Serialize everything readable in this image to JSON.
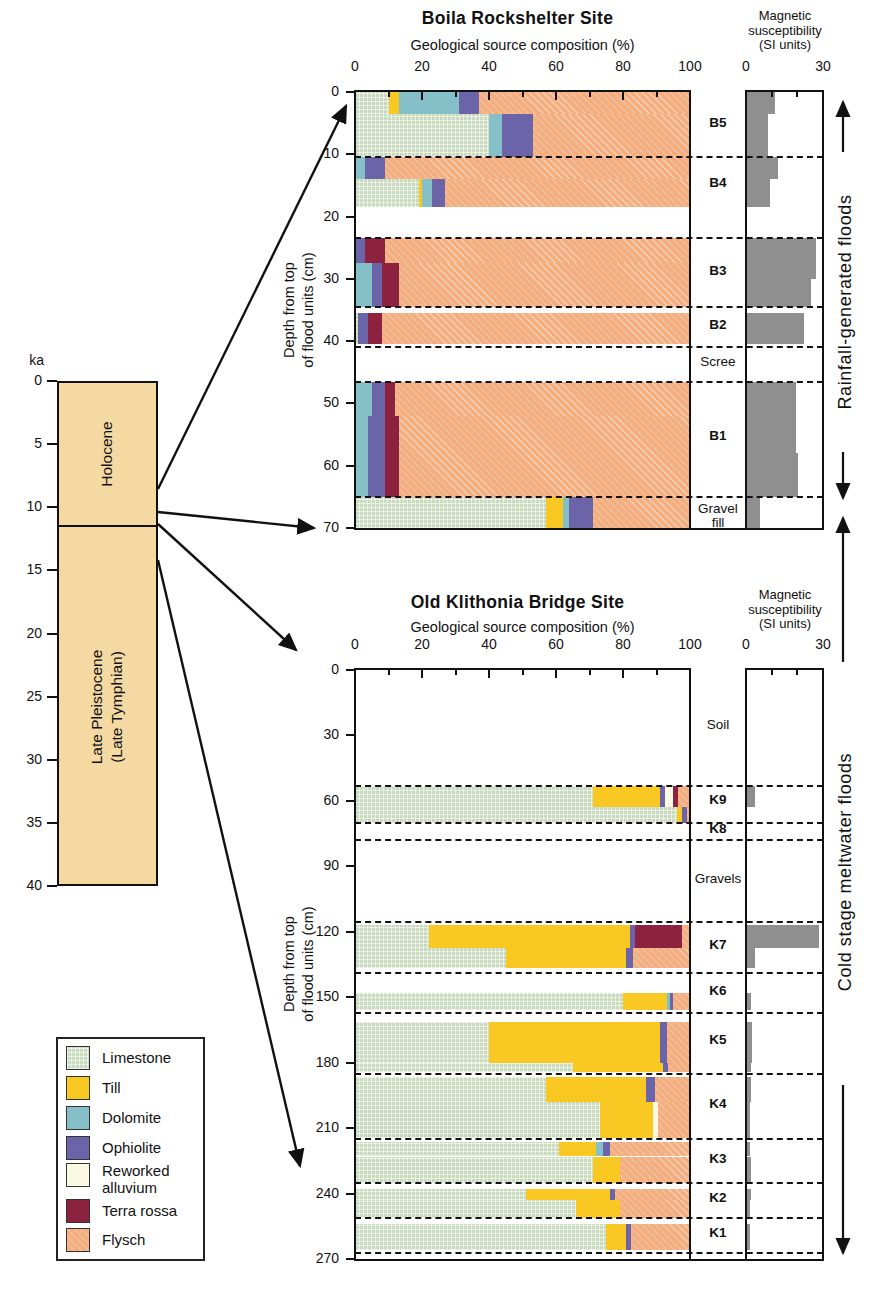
{
  "palette": {
    "axis_line": "#111111",
    "ms_bar": "#8f8f8f",
    "timeline_fill": "#f4d9a2"
  },
  "legend": {
    "items": [
      {
        "label": "Limestone",
        "color": "#c9dabf",
        "pattern": "grid"
      },
      {
        "label": "Till",
        "color": "#f9c823",
        "pattern": "solid"
      },
      {
        "label": "Dolomite",
        "color": "#85bfc7",
        "pattern": "solid"
      },
      {
        "label": "Ophiolite",
        "color": "#6b64a9",
        "pattern": "solid"
      },
      {
        "label": "Reworked alluvium",
        "color": "#fafae2",
        "pattern": "solid"
      },
      {
        "label": "Terra rossa",
        "color": "#8c2140",
        "pattern": "solid"
      },
      {
        "label": "Flysch",
        "color": "#f5ae80",
        "pattern": "diag"
      }
    ]
  },
  "timeline": {
    "axis_label": "ka",
    "ticks": [
      0,
      5,
      10,
      15,
      20,
      25,
      30,
      35,
      40
    ],
    "range": [
      0,
      40
    ],
    "epochs": [
      {
        "name": "Holocene",
        "start_ka": 0,
        "end_ka": 11.5
      },
      {
        "name_lines": [
          "Late Pleistocene",
          "(Late Tymphian)"
        ],
        "start_ka": 11.5,
        "end_ka": 40
      }
    ]
  },
  "flood_arrows": [
    {
      "label": "Rainfall-generated floods"
    },
    {
      "label": "Cold stage meltwater floods"
    }
  ],
  "chart_data": [
    {
      "type": "bar",
      "site": "Boila Rockshelter Site",
      "xlabel": "Geological source composition (%)",
      "x_range": [
        0,
        100
      ],
      "x_ticks": [
        0,
        20,
        40,
        60,
        80,
        100
      ],
      "x_minor_ticks": [
        10,
        30,
        50,
        70,
        90
      ],
      "depth_axis_label_lines": [
        "Depth from top",
        "of flood units (cm)"
      ],
      "depth_ticks": [
        0,
        10,
        20,
        30,
        40,
        50,
        60,
        70
      ],
      "depth_range": [
        0,
        70
      ],
      "ms_title_lines": [
        "Magnetic",
        "susceptibility",
        "(SI units)"
      ],
      "ms_ticks": [
        0,
        30
      ],
      "ms_minor_ticks": [
        10,
        20
      ],
      "ms_range": [
        0,
        30
      ],
      "unit_boundaries_cm": [
        10.5,
        23.5,
        34.5,
        41,
        46.5,
        65
      ],
      "units": [
        {
          "name": "B5",
          "label_depth_cm": 5.3,
          "bold": true
        },
        {
          "name": "B4",
          "label_depth_cm": 15,
          "bold": true
        },
        {
          "name": "B3",
          "label_depth_cm": 29,
          "bold": true
        },
        {
          "name": "B2",
          "label_depth_cm": 37.7,
          "bold": true
        },
        {
          "name": "Scree",
          "label_depth_cm": 43.7,
          "bold": false
        },
        {
          "name": "B1",
          "label_depth_cm": 55.5,
          "bold": true
        },
        {
          "name": "Gravel fill",
          "label_depth_cm": 67.3,
          "bold": false
        }
      ],
      "bars": [
        {
          "depth_top": 0,
          "depth_bottom": 3.5,
          "segments": [
            [
              "Limestone",
              10
            ],
            [
              "Till",
              3
            ],
            [
              "Dolomite",
              18
            ],
            [
              "Ophiolite",
              6
            ],
            [
              "Flysch",
              63
            ]
          ]
        },
        {
          "depth_top": 3.5,
          "depth_bottom": 10.5,
          "segments": [
            [
              "Limestone",
              40
            ],
            [
              "Dolomite",
              4
            ],
            [
              "Ophiolite",
              9
            ],
            [
              "Flysch",
              47
            ]
          ]
        },
        {
          "depth_top": 10.5,
          "depth_bottom": 14,
          "segments": [
            [
              "Dolomite",
              3
            ],
            [
              "Ophiolite",
              6
            ],
            [
              "Flysch",
              91
            ]
          ]
        },
        {
          "depth_top": 14,
          "depth_bottom": 18.5,
          "segments": [
            [
              "Limestone",
              19
            ],
            [
              "Till",
              1
            ],
            [
              "Dolomite",
              3
            ],
            [
              "Ophiolite",
              4
            ],
            [
              "Flysch",
              73
            ]
          ]
        },
        {
          "depth_top": 23.5,
          "depth_bottom": 27.5,
          "segments": [
            [
              "Ophiolite",
              3
            ],
            [
              "Terra rossa",
              6
            ],
            [
              "Flysch",
              91
            ]
          ]
        },
        {
          "depth_top": 27.5,
          "depth_bottom": 34.5,
          "segments": [
            [
              "Dolomite",
              5
            ],
            [
              "Ophiolite",
              3
            ],
            [
              "Terra rossa",
              5
            ],
            [
              "Flysch",
              87
            ]
          ]
        },
        {
          "depth_top": 35.5,
          "depth_bottom": 40.5,
          "segments": [
            [
              "Limestone",
              1
            ],
            [
              "Ophiolite",
              3
            ],
            [
              "Terra rossa",
              4
            ],
            [
              "Flysch",
              92
            ]
          ]
        },
        {
          "depth_top": 46.5,
          "depth_bottom": 52,
          "segments": [
            [
              "Dolomite",
              5
            ],
            [
              "Ophiolite",
              4
            ],
            [
              "Terra rossa",
              3
            ],
            [
              "Flysch",
              88
            ]
          ]
        },
        {
          "depth_top": 52,
          "depth_bottom": 65,
          "segments": [
            [
              "Dolomite",
              4
            ],
            [
              "Ophiolite",
              5
            ],
            [
              "Terra rossa",
              4
            ],
            [
              "Flysch",
              87
            ]
          ]
        },
        {
          "depth_top": 65,
          "depth_bottom": 70,
          "segments": [
            [
              "Limestone",
              57
            ],
            [
              "Till",
              5
            ],
            [
              "Dolomite",
              2
            ],
            [
              "Ophiolite",
              7
            ],
            [
              "Flysch",
              29
            ]
          ]
        }
      ],
      "ms_bars": [
        {
          "depth_top": 0,
          "depth_bottom": 3.5,
          "value": 11
        },
        {
          "depth_top": 3.5,
          "depth_bottom": 10.5,
          "value": 8
        },
        {
          "depth_top": 10.5,
          "depth_bottom": 14,
          "value": 12
        },
        {
          "depth_top": 14,
          "depth_bottom": 18.5,
          "value": 9
        },
        {
          "depth_top": 23.5,
          "depth_bottom": 30,
          "value": 27
        },
        {
          "depth_top": 30,
          "depth_bottom": 34.5,
          "value": 25
        },
        {
          "depth_top": 35.5,
          "depth_bottom": 40.5,
          "value": 22
        },
        {
          "depth_top": 46.5,
          "depth_bottom": 58,
          "value": 19
        },
        {
          "depth_top": 58,
          "depth_bottom": 65,
          "value": 20
        },
        {
          "depth_top": 65,
          "depth_bottom": 70,
          "value": 5
        }
      ]
    },
    {
      "type": "bar",
      "site": "Old Klithonia Bridge Site",
      "xlabel": "Geological source composition (%)",
      "x_range": [
        0,
        100
      ],
      "x_ticks": [
        0,
        20,
        40,
        60,
        80,
        100
      ],
      "x_minor_ticks": [
        10,
        30,
        50,
        70,
        90
      ],
      "depth_axis_label_lines": [
        "Depth from top",
        "of flood units (cm)"
      ],
      "depth_ticks": [
        0,
        30,
        60,
        90,
        120,
        150,
        180,
        210,
        240,
        270
      ],
      "depth_range": [
        0,
        270
      ],
      "ms_title_lines": [
        "Magnetic",
        "susceptibility",
        "(SI units)"
      ],
      "ms_ticks": [
        0,
        30
      ],
      "ms_minor_ticks": [
        10,
        20
      ],
      "ms_range": [
        0,
        30
      ],
      "unit_boundaries_cm": [
        53,
        70,
        78,
        115.5,
        139,
        157,
        185,
        215,
        235,
        251,
        267
      ],
      "units": [
        {
          "name": "Soil",
          "label_depth_cm": 26,
          "bold": false
        },
        {
          "name": "K9",
          "label_depth_cm": 60.5,
          "bold": true
        },
        {
          "name": "K8",
          "label_depth_cm": 74,
          "bold": true
        },
        {
          "name": "Gravels",
          "label_depth_cm": 96.5,
          "bold": false
        },
        {
          "name": "K7",
          "label_depth_cm": 127,
          "bold": true
        },
        {
          "name": "K6",
          "label_depth_cm": 148,
          "bold": true
        },
        {
          "name": "K5",
          "label_depth_cm": 170.5,
          "bold": true
        },
        {
          "name": "K4",
          "label_depth_cm": 200,
          "bold": true
        },
        {
          "name": "K3",
          "label_depth_cm": 225,
          "bold": true
        },
        {
          "name": "K2",
          "label_depth_cm": 243,
          "bold": true
        },
        {
          "name": "K1",
          "label_depth_cm": 259,
          "bold": true
        }
      ],
      "bars": [
        {
          "depth_top": 53,
          "depth_bottom": 63,
          "segments": [
            [
              "Limestone",
              71
            ],
            [
              "Till",
              20
            ],
            [
              "Ophiolite",
              1.5
            ],
            [
              "Reworked alluvium",
              2.5
            ],
            [
              "Terra rossa",
              1.5
            ],
            [
              "Flysch",
              3.5
            ]
          ]
        },
        {
          "depth_top": 63,
          "depth_bottom": 70,
          "segments": [
            [
              "Limestone",
              96
            ],
            [
              "Till",
              1.5
            ],
            [
              "Ophiolite",
              1.5
            ],
            [
              "Flysch",
              1
            ]
          ]
        },
        {
          "depth_top": 117,
          "depth_bottom": 127.5,
          "segments": [
            [
              "Limestone",
              22
            ],
            [
              "Till",
              60
            ],
            [
              "Ophiolite",
              1.5
            ],
            [
              "Terra rossa",
              14
            ],
            [
              "Flysch",
              2.5
            ]
          ]
        },
        {
          "depth_top": 127.5,
          "depth_bottom": 136.5,
          "segments": [
            [
              "Limestone",
              45
            ],
            [
              "Till",
              36
            ],
            [
              "Ophiolite",
              2
            ],
            [
              "Flysch",
              17
            ]
          ]
        },
        {
          "depth_top": 148,
          "depth_bottom": 156,
          "segments": [
            [
              "Limestone",
              80
            ],
            [
              "Till",
              13
            ],
            [
              "Dolomite",
              1
            ],
            [
              "Ophiolite",
              1
            ],
            [
              "Flysch",
              5
            ]
          ]
        },
        {
          "depth_top": 161.5,
          "depth_bottom": 180,
          "segments": [
            [
              "Limestone",
              40
            ],
            [
              "Till",
              51
            ],
            [
              "Ophiolite",
              2
            ],
            [
              "Flysch",
              7
            ]
          ]
        },
        {
          "depth_top": 180,
          "depth_bottom": 184.5,
          "segments": [
            [
              "Limestone",
              65
            ],
            [
              "Till",
              27
            ],
            [
              "Ophiolite",
              1.5
            ],
            [
              "Flysch",
              6.5
            ]
          ]
        },
        {
          "depth_top": 186.5,
          "depth_bottom": 198,
          "segments": [
            [
              "Limestone",
              57
            ],
            [
              "Till",
              30
            ],
            [
              "Ophiolite",
              2.5
            ],
            [
              "Flysch",
              10.5
            ]
          ]
        },
        {
          "depth_top": 198,
          "depth_bottom": 214.5,
          "segments": [
            [
              "Limestone",
              73
            ],
            [
              "Till",
              16
            ],
            [
              "Reworked alluvium",
              1.5
            ],
            [
              "Flysch",
              9.5
            ]
          ]
        },
        {
          "depth_top": 216.5,
          "depth_bottom": 223,
          "segments": [
            [
              "Limestone",
              61
            ],
            [
              "Till",
              11
            ],
            [
              "Dolomite",
              2
            ],
            [
              "Ophiolite",
              2
            ],
            [
              "Flysch",
              24
            ]
          ]
        },
        {
          "depth_top": 223,
          "depth_bottom": 235,
          "segments": [
            [
              "Limestone",
              71
            ],
            [
              "Till",
              8
            ],
            [
              "Flysch",
              21
            ]
          ]
        },
        {
          "depth_top": 238,
          "depth_bottom": 243,
          "segments": [
            [
              "Limestone",
              51
            ],
            [
              "Till",
              25
            ],
            [
              "Ophiolite",
              1.5
            ],
            [
              "Flysch",
              22.5
            ]
          ]
        },
        {
          "depth_top": 243,
          "depth_bottom": 251,
          "segments": [
            [
              "Limestone",
              66
            ],
            [
              "Till",
              13
            ],
            [
              "Flysch",
              21
            ]
          ]
        },
        {
          "depth_top": 254,
          "depth_bottom": 266,
          "segments": [
            [
              "Limestone",
              75
            ],
            [
              "Till",
              6
            ],
            [
              "Ophiolite",
              1.5
            ],
            [
              "Flysch",
              17.5
            ]
          ]
        }
      ],
      "ms_bars": [
        {
          "depth_top": 53,
          "depth_bottom": 63,
          "value": 3
        },
        {
          "depth_top": 117,
          "depth_bottom": 127.5,
          "value": 28
        },
        {
          "depth_top": 127.5,
          "depth_bottom": 136.5,
          "value": 3
        },
        {
          "depth_top": 148,
          "depth_bottom": 156,
          "value": 1.5
        },
        {
          "depth_top": 161.5,
          "depth_bottom": 180,
          "value": 2
        },
        {
          "depth_top": 180,
          "depth_bottom": 184.5,
          "value": 1.5
        },
        {
          "depth_top": 186.5,
          "depth_bottom": 198,
          "value": 1.5
        },
        {
          "depth_top": 198,
          "depth_bottom": 214.5,
          "value": 1
        },
        {
          "depth_top": 216.5,
          "depth_bottom": 223,
          "value": 1
        },
        {
          "depth_top": 223,
          "depth_bottom": 235,
          "value": 1.5
        },
        {
          "depth_top": 238,
          "depth_bottom": 243,
          "value": 1.5
        },
        {
          "depth_top": 243,
          "depth_bottom": 251,
          "value": 1
        },
        {
          "depth_top": 254,
          "depth_bottom": 266,
          "value": 1
        }
      ]
    }
  ]
}
